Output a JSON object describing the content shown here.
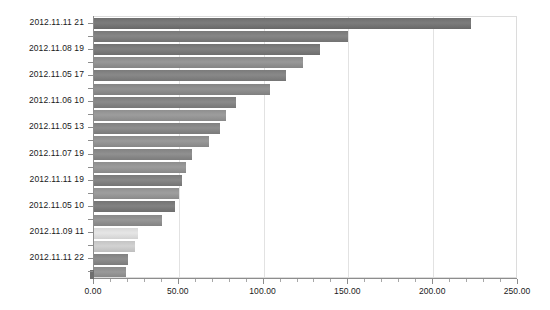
{
  "chart_data": {
    "type": "bar",
    "orientation": "horizontal",
    "title": "",
    "subtitle": "",
    "xlabel": "",
    "ylabel": "",
    "xlim": [
      0,
      250
    ],
    "ylim": null,
    "grid": true,
    "legend": null,
    "legend_position": "none",
    "x_tick_labels": [
      "0.00",
      "50.00",
      "100.00",
      "150.00",
      "200.00",
      "250.00"
    ],
    "x_tick_values": [
      0,
      50,
      100,
      150,
      200,
      250
    ],
    "x_minor_tick_step": 10,
    "categories": [
      "2012.11.11 21",
      "",
      "2012.11.08 19",
      "",
      "2012.11.05 17",
      "",
      "2012.11.06 10",
      "",
      "2012.11.05 13",
      "",
      "2012.11.07 19",
      "",
      "2012.11.11 19",
      "",
      "2012.11.05 10",
      "",
      "2012.11.09 11",
      "",
      "2012.11.11 22",
      ""
    ],
    "visible_tick_labels": [
      "2012.11.11 21",
      "2012.11.08 19",
      "2012.11.05 17",
      "2012.11.06 10",
      "2012.11.05 13",
      "2012.11.07 19",
      "2012.11.11 19",
      "2012.11.05 10",
      "2012.11.09 11",
      "2012.11.11 22"
    ],
    "values": [
      222,
      150,
      133,
      123,
      113,
      104,
      84,
      78,
      74,
      68,
      58,
      54,
      52,
      50,
      48,
      40,
      26,
      24,
      20,
      19
    ],
    "bars": [
      {
        "label": "2012.11.11 21",
        "value": 222,
        "color": "#6e6e6e"
      },
      {
        "label": "",
        "value": 150,
        "color": "#787878"
      },
      {
        "label": "2012.11.08 19",
        "value": 133,
        "color": "#737373"
      },
      {
        "label": "",
        "value": 123,
        "color": "#8a8a8a"
      },
      {
        "label": "2012.11.05 17",
        "value": 113,
        "color": "#7b7b7b"
      },
      {
        "label": "",
        "value": 104,
        "color": "#858585"
      },
      {
        "label": "2012.11.06 10",
        "value": 84,
        "color": "#7d7d7d"
      },
      {
        "label": "",
        "value": 78,
        "color": "#8f8f8f"
      },
      {
        "label": "2012.11.05 13",
        "value": 74,
        "color": "#808080"
      },
      {
        "label": "",
        "value": 68,
        "color": "#8c8c8c"
      },
      {
        "label": "2012.11.07 19",
        "value": 58,
        "color": "#828282"
      },
      {
        "label": "",
        "value": 54,
        "color": "#8e8e8e"
      },
      {
        "label": "2012.11.11 19",
        "value": 52,
        "color": "#7a7a7a"
      },
      {
        "label": "",
        "value": 50,
        "color": "#909090"
      },
      {
        "label": "2012.11.05 10",
        "value": 48,
        "color": "#747474"
      },
      {
        "label": "",
        "value": 40,
        "color": "#898989"
      },
      {
        "label": "2012.11.09 11",
        "value": 26,
        "color": "#d8d8d8"
      },
      {
        "label": "",
        "value": 24,
        "color": "#c4c4c4"
      },
      {
        "label": "2012.11.11 22",
        "value": 20,
        "color": "#818181"
      },
      {
        "label": "",
        "value": 19,
        "color": "#8b8b8b"
      }
    ],
    "colors": {
      "bar_default": "#808080",
      "bar_highlight_light": "#d8d8d8",
      "gridline": "#e2e2e2",
      "axis": "#8d8d8d",
      "plot_border": "#dcdcdc",
      "text": "#1a1a1a",
      "background": "#ffffff"
    }
  }
}
